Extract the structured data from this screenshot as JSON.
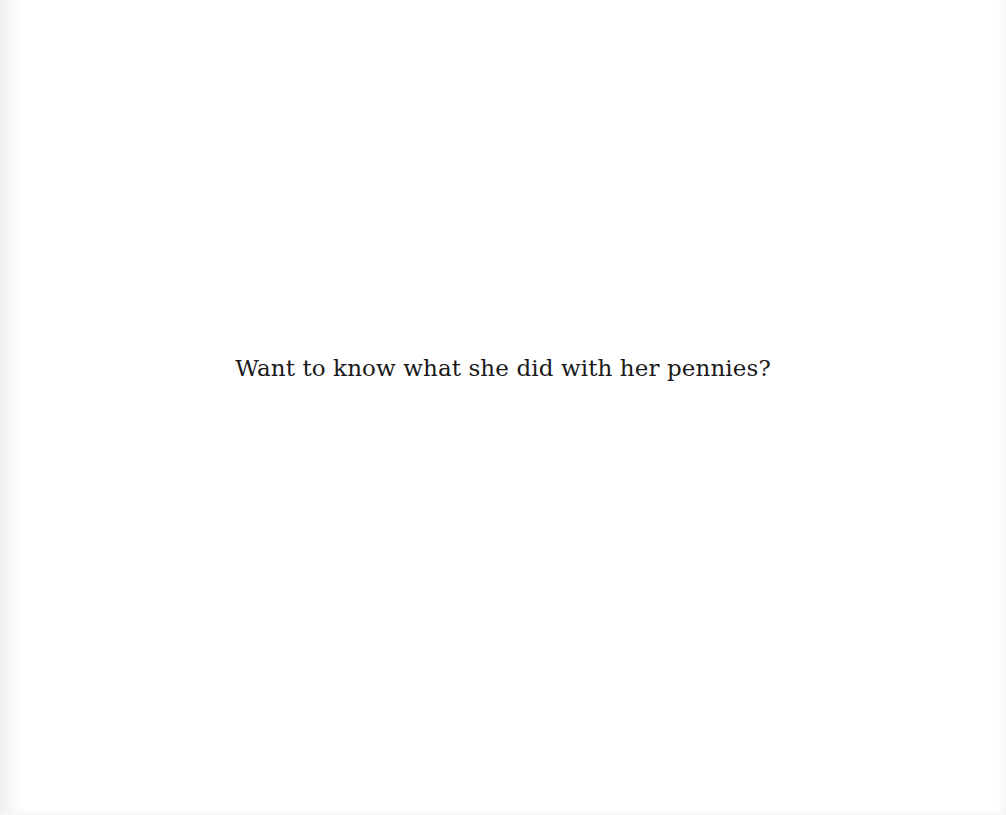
{
  "page": {
    "text_lines": [
      "Want to know what she did with her pennies?"
    ],
    "background_color": "#ffffff",
    "text_color": "#1a1a1a"
  }
}
